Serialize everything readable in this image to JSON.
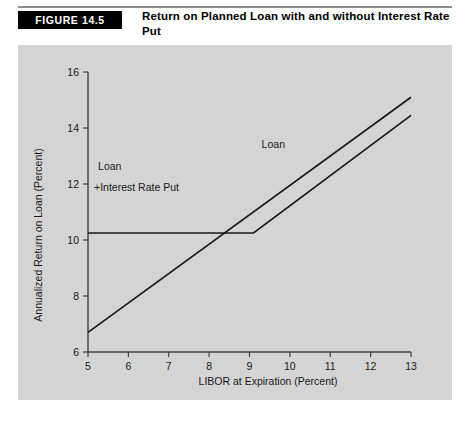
{
  "header": {
    "figure_tag": "FIGURE 14.5",
    "title": "Return on Planned Loan with and without Interest Rate Put"
  },
  "chart_data": {
    "type": "line",
    "title": "Return on Planned Loan with and without Interest Rate Put",
    "xlabel": "LIBOR at Expiration (Percent)",
    "ylabel": "Annualized Return on Loan (Percent)",
    "xlim": [
      5,
      13
    ],
    "ylim": [
      6,
      16
    ],
    "xticks": [
      5,
      6,
      7,
      8,
      9,
      10,
      11,
      12,
      13
    ],
    "xticklabels": [
      "5",
      "6",
      "7",
      "8",
      "9",
      "10",
      "11",
      "12",
      "13"
    ],
    "yticks": [
      6,
      8,
      10,
      12,
      14,
      16
    ],
    "yticklabels": [
      "6",
      "8",
      "10",
      "12",
      "14",
      "16"
    ],
    "grid": false,
    "legend": "inline-annotations",
    "background": "#d4d4d4",
    "line_color": "#1a1a1a",
    "series": [
      {
        "name": "Loan",
        "label": "Loan",
        "x": [
          5,
          13
        ],
        "y": [
          6.7,
          15.1
        ],
        "label_x": 9.3,
        "label_y": 13.3
      },
      {
        "name": "Loan + Interest Rate Put",
        "label_line1": "Loan",
        "label_line2": "+Interest Rate Put",
        "x": [
          5,
          9.1,
          13
        ],
        "y": [
          10.25,
          10.25,
          14.45
        ],
        "kink_x": 9.1,
        "kink_y": 10.25,
        "label_x": 5.25,
        "label_y": 12.15
      }
    ],
    "annotations": [
      {
        "text": "Loan",
        "x": 9.3,
        "y": 13.3
      },
      {
        "text": "Loan",
        "x": 5.25,
        "y": 12.5
      },
      {
        "text": "+Interest Rate Put",
        "x": 5.15,
        "y": 11.75
      }
    ]
  }
}
